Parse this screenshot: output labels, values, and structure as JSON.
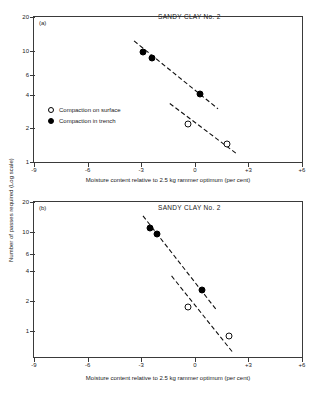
{
  "figure": {
    "y_axis_title": "Number of passes required (Log scale)",
    "x_axis_title": "Moisture content relative to 2.5 kg rammer optimum (per cent)"
  },
  "legend": {
    "items": [
      {
        "marker": "open-circle",
        "label": "Compaction on surface"
      },
      {
        "marker": "filled-circle",
        "label": "Compaction in trench"
      }
    ]
  },
  "chart_data": [
    {
      "type": "scatter",
      "panel": "(a)",
      "title": "SANDY CLAY No. 2",
      "xlabel": "Moisture content relative to 2.5 kg rammer optimum (per cent)",
      "ylabel": "Number of passes required (Log scale)",
      "xlim": [
        -9,
        6
      ],
      "ylim": [
        1,
        20
      ],
      "yscale": "log",
      "grid": false,
      "legend_position": "inside-left",
      "xticks": [
        "-9",
        "-6",
        "-3",
        "0",
        "+3",
        "+6"
      ],
      "xtickvalues": [
        -9,
        -6,
        -3,
        0,
        3,
        6
      ],
      "yticks": [
        "1",
        "2",
        "4",
        "6",
        "10",
        "20"
      ],
      "ytickvalues": [
        1,
        2,
        4,
        6,
        10,
        20
      ],
      "series": [
        {
          "name": "Compaction in trench",
          "marker": "filled-circle",
          "points": [
            {
              "x": -2.9,
              "y": 9.8
            },
            {
              "x": -2.4,
              "y": 8.5
            },
            {
              "x": 0.3,
              "y": 4.1
            }
          ],
          "trendline": {
            "style": "dashed",
            "x1": -3.4,
            "y1": 12.2,
            "x2": 1.3,
            "y2": 3.0
          }
        },
        {
          "name": "Compaction on surface",
          "marker": "open-circle",
          "points": [
            {
              "x": -0.4,
              "y": 2.2
            },
            {
              "x": 1.8,
              "y": 1.45
            }
          ],
          "trendline": {
            "style": "dashed",
            "x1": -1.4,
            "y1": 3.35,
            "x2": 2.3,
            "y2": 1.2
          }
        }
      ]
    },
    {
      "type": "scatter",
      "panel": "(b)",
      "title": "SANDY CLAY No. 2",
      "xlabel": "Moisture content relative to 2.5 kg rammer optimum (per cent)",
      "ylabel": "Number of passes required (Log scale)",
      "xlim": [
        -9,
        6
      ],
      "ylim": [
        0.55,
        20
      ],
      "yscale": "log",
      "grid": false,
      "legend_position": "none",
      "xticks": [
        "-9",
        "-6",
        "-3",
        "0",
        "+3",
        "+6"
      ],
      "xtickvalues": [
        -9,
        -6,
        -3,
        0,
        3,
        6
      ],
      "yticks": [
        "1",
        "2",
        "4",
        "6",
        "10",
        "20"
      ],
      "ytickvalues": [
        1,
        2,
        4,
        6,
        10,
        20
      ],
      "series": [
        {
          "name": "Compaction in trench",
          "marker": "filled-circle",
          "points": [
            {
              "x": -2.5,
              "y": 11.0
            },
            {
              "x": -2.1,
              "y": 9.6
            },
            {
              "x": 0.4,
              "y": 2.6
            }
          ],
          "trendline": {
            "style": "dashed",
            "x1": -2.9,
            "y1": 14.5,
            "x2": 1.2,
            "y2": 1.65
          }
        },
        {
          "name": "Compaction on surface",
          "marker": "open-circle",
          "points": [
            {
              "x": -0.4,
              "y": 1.75
            },
            {
              "x": 1.9,
              "y": 0.9
            }
          ],
          "trendline": {
            "style": "dashed",
            "x1": -1.3,
            "y1": 3.6,
            "x2": 2.1,
            "y2": 0.62
          }
        }
      ]
    }
  ]
}
